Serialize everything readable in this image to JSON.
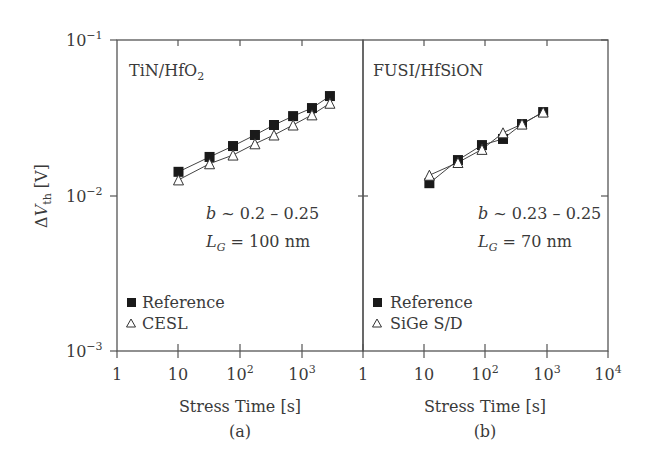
{
  "chart_data": [
    {
      "type": "line",
      "panel_label": "(a)",
      "title": "TiN/HfO2",
      "xlabel": "Stress Time [s]",
      "ylabel": "ΔVth [V]",
      "xscale": "log",
      "yscale": "log",
      "xlim": [
        1,
        10000
      ],
      "ylim": [
        0.001,
        0.1
      ],
      "x_ticks": [
        "1",
        "10",
        "10^2",
        "10^3"
      ],
      "y_ticks": [
        "10^-1",
        "10^-2",
        "10^-3"
      ],
      "annotations": [
        "b ~ 0.2 – 0.25",
        "L_G = 100 nm"
      ],
      "legend_position": "lower left",
      "series": [
        {
          "name": "Reference",
          "marker": "filled-square",
          "x": [
            10,
            32,
            77,
            175,
            357,
            730,
            1480,
            2900
          ],
          "y": [
            0.0142,
            0.0177,
            0.0208,
            0.0245,
            0.0284,
            0.0324,
            0.0365,
            0.0436
          ]
        },
        {
          "name": "CESL",
          "marker": "open-triangle",
          "x": [
            10,
            32,
            77,
            175,
            357,
            730,
            1480,
            2900
          ],
          "y": [
            0.0126,
            0.016,
            0.0182,
            0.0215,
            0.0245,
            0.0284,
            0.033,
            0.0392
          ]
        }
      ]
    },
    {
      "type": "line",
      "panel_label": "(b)",
      "title": "FUSI/HfSiON",
      "xlabel": "Stress Time [s]",
      "ylabel": "ΔVth [V]",
      "xscale": "log",
      "yscale": "log",
      "xlim": [
        1,
        10000
      ],
      "ylim": [
        0.001,
        0.1
      ],
      "x_ticks": [
        "1",
        "10",
        "10^2",
        "10^3",
        "10^4"
      ],
      "annotations": [
        "b ~ 0.23 – 0.25",
        "L_G = 70 nm"
      ],
      "legend_position": "lower left",
      "series": [
        {
          "name": "Reference",
          "marker": "filled-square",
          "x": [
            12,
            35,
            86,
            189,
            385,
            850
          ],
          "y": [
            0.012,
            0.0169,
            0.0211,
            0.0231,
            0.0288,
            0.0344
          ]
        },
        {
          "name": "SiGe S/D",
          "marker": "open-triangle",
          "x": [
            12,
            35,
            86,
            189,
            385,
            850
          ],
          "y": [
            0.0135,
            0.0163,
            0.0198,
            0.0253,
            0.0288,
            0.0344
          ]
        }
      ]
    }
  ],
  "labels": {
    "ylabel_delta": "Δ",
    "ylabel_v": "V",
    "ylabel_sub": "th",
    "ylabel_unit": " [V]",
    "y_tick_base": "10",
    "y_tick_exp": [
      "−1",
      "−2",
      "−3"
    ],
    "x_tick_base": "10",
    "x_tick_one": "1",
    "x_tick_ten": "10",
    "x_tick_exp": [
      "2",
      "3",
      "4"
    ],
    "a_title_main": "TiN/HfO",
    "a_title_sub": "2",
    "b_title": "FUSI/HfSiON",
    "a_b_line": "b ~ 0.2 – 0.25",
    "a_b_var": "b",
    "a_b_rest": " ~ 0.2 – 0.25",
    "a_lg_var": "L",
    "a_lg_sub": "G",
    "a_lg_rest": " = 100 nm",
    "b_b_var": "b",
    "b_b_rest": " ~ 0.23 – 0.25",
    "b_lg_var": "L",
    "b_lg_sub": "G",
    "b_lg_rest": " = 70 nm",
    "a_legend_ref": "Reference",
    "a_legend_cesl": "CESL",
    "b_legend_ref": "Reference",
    "b_legend_sige": "SiGe S/D",
    "xlabel": "Stress Time [s]",
    "a_caption": "(a)",
    "b_caption": "(b)"
  },
  "colors": {
    "axis": "#555555",
    "marker_fill": "#1a1a1a",
    "text": "#3a3a3a"
  }
}
